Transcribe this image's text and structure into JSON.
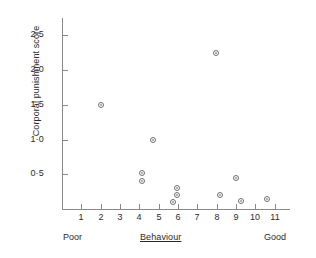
{
  "chart_data": {
    "type": "scatter",
    "title": "",
    "xlabel": "Behaviour",
    "ylabel": "Corporal punishment score",
    "x_axis_low_anchor": "Poor",
    "x_axis_high_anchor": "Good",
    "xlim": [
      0,
      11.8
    ],
    "ylim": [
      0,
      2.75
    ],
    "grid": false,
    "legend": "none",
    "marker": "open-circle",
    "xticks": [
      1,
      2,
      3,
      4,
      5,
      6,
      7,
      8,
      9,
      10,
      11
    ],
    "xtick_labels": [
      "1",
      "2",
      "3",
      "4",
      "5",
      "6",
      "7",
      "8",
      "9",
      "10",
      "11"
    ],
    "yticks": [
      0.5,
      1.0,
      1.5,
      2.0,
      2.5
    ],
    "ytick_labels": [
      "0·5",
      "1·0",
      "1·5",
      "2·0",
      "2·5"
    ],
    "points": [
      {
        "x": 2.0,
        "y": 1.5
      },
      {
        "x": 4.15,
        "y": 0.52
      },
      {
        "x": 4.15,
        "y": 0.4
      },
      {
        "x": 4.7,
        "y": 1.0
      },
      {
        "x": 5.95,
        "y": 0.3
      },
      {
        "x": 5.95,
        "y": 0.2
      },
      {
        "x": 5.75,
        "y": 0.1
      },
      {
        "x": 7.95,
        "y": 2.25
      },
      {
        "x": 8.2,
        "y": 0.2
      },
      {
        "x": 9.0,
        "y": 0.45
      },
      {
        "x": 9.25,
        "y": 0.12
      },
      {
        "x": 10.6,
        "y": 0.14
      }
    ],
    "axis_color": "#8a8a8a",
    "marker_color": "#6f6f6f",
    "text_color": "#2b2b2b",
    "background": "#ffffff"
  }
}
